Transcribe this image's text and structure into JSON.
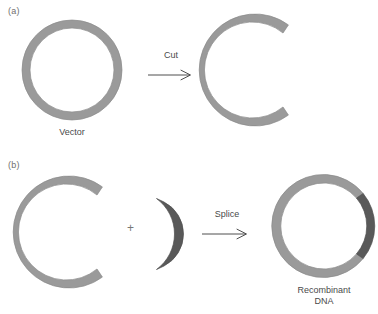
{
  "figure": {
    "type": "biology-schematic",
    "background_color": "#ffffff",
    "colors": {
      "vector_ring": "#9a9a9a",
      "vector_ring_edge": "#8a8a8a",
      "insert_fragment": "#595959",
      "insert_fragment_edge": "#4f4f4f",
      "text": "#4a4a4a",
      "panel_label_text": "#6f6f6f",
      "arrow": "#3a3a3a"
    }
  },
  "panels": [
    {
      "id": "a",
      "label": "(a)",
      "shapes": [
        {
          "name": "vector-plasmid-circle",
          "role": "intact circular vector (plasmid)",
          "geometry": {
            "center_x": 72,
            "center_y": 70,
            "outer_radius": 50,
            "inner_radius": 42,
            "start_angle_deg": 0,
            "end_angle_deg": 360
          },
          "color": "#9a9a9a",
          "caption": "Vector"
        },
        {
          "name": "cut-vector-arc",
          "role": "linearized / cut vector, gap opens to the right",
          "geometry": {
            "center_x": 251,
            "center_y": 69,
            "outer_radius": 52,
            "inner_radius": 44,
            "start_angle_deg": -52,
            "end_angle_deg": 232
          },
          "color": "#9a9a9a",
          "caption": ""
        }
      ],
      "operation": {
        "name": "cut",
        "label": "Cut",
        "arrow": {
          "x1": 149,
          "y1": 75,
          "x2": 192,
          "y2": 75,
          "direction": "right"
        }
      }
    },
    {
      "id": "b",
      "label": "(b)",
      "shapes": [
        {
          "name": "cut-vector-arc",
          "role": "cut vector ready to receive insert",
          "geometry": {
            "center_x": 65,
            "center_y": 231,
            "outer_radius": 52,
            "inner_radius": 44,
            "start_angle_deg": -52,
            "end_angle_deg": 232
          },
          "color": "#9a9a9a",
          "caption": ""
        },
        {
          "name": "dna-insert-fragment",
          "role": "DNA fragment to be inserted",
          "geometry": {
            "center_x": 113,
            "center_y": 233,
            "outer_radius": 70,
            "inner_radius": 62,
            "start_angle_deg": -28,
            "end_angle_deg": 28
          },
          "color": "#595959",
          "caption": ""
        },
        {
          "name": "recombinant-dna-circle",
          "role": "closed recombinant plasmid with insert spliced in",
          "geometry": {
            "center_x": 323,
            "center_y": 225,
            "outer_radius": 47,
            "inner_radius": 39,
            "start_angle_deg": 0,
            "end_angle_deg": 360
          },
          "color": "#9a9a9a",
          "insert_segment": {
            "start_angle_deg": -40,
            "end_angle_deg": 40,
            "color": "#595959"
          },
          "caption": "Recombinant\nDNA"
        }
      ],
      "operation": {
        "name": "splice",
        "label": "Splice",
        "arrow": {
          "x1": 203,
          "y1": 233,
          "x2": 250,
          "y2": 233,
          "direction": "right"
        },
        "combiner": "+"
      }
    }
  ],
  "labels": {
    "panel_a": "(a)",
    "panel_b": "(b)",
    "vector": "Vector",
    "cut": "Cut",
    "splice": "Splice",
    "plus": "+",
    "recombinant_dna": "Recombinant\nDNA"
  }
}
